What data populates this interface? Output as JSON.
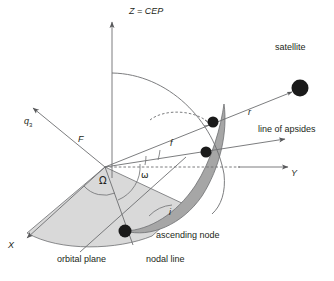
{
  "figure": {
    "background_color": "#ffffff",
    "line_color": "#58595b",
    "text_color": "#231f20",
    "equatorial_wedge_fill": "#d9d9d9",
    "orbital_wedge_fill": "#a6a6a6",
    "dot_color": "#1a1a1a"
  },
  "axes": [
    {
      "id": "z-axis",
      "label": "Z = CEP",
      "label_x": 129,
      "label_y": 8,
      "arrow": true
    },
    {
      "id": "y-axis",
      "label": "Y",
      "label_x": 291,
      "label_y": 174,
      "arrow": true
    },
    {
      "id": "x-axis",
      "label": "X",
      "label_x": 8,
      "label_y": 246,
      "arrow": true
    },
    {
      "id": "q3-axis",
      "label": "q",
      "sub": "3",
      "label_x": 24,
      "label_y": 122,
      "arrow": true
    }
  ],
  "labels": {
    "focus": "F",
    "satellite": "satellite",
    "radius": "r",
    "line_of_apsides": "line of apsides",
    "true_anomaly": "f",
    "arg_of_perigee": "ω",
    "raan": "Ω",
    "inclination": "i",
    "ascending_node": "ascending node",
    "orbital_plane": "orbital plane",
    "nodal_line": "nodal line"
  },
  "label_positions": {
    "focus": {
      "x": 78,
      "y": 140
    },
    "satellite": {
      "x": 275,
      "y": 48
    },
    "radius": {
      "x": 248,
      "y": 113
    },
    "line_of_apsides": {
      "x": 258,
      "y": 130
    },
    "true_anomaly": {
      "x": 170,
      "y": 144
    },
    "arg_of_perigee": {
      "x": 141,
      "y": 176
    },
    "raan": {
      "x": 99,
      "y": 182
    },
    "inclination": {
      "x": 169,
      "y": 213
    },
    "ascending_node": {
      "x": 156,
      "y": 236
    },
    "orbital_plane": {
      "x": 57,
      "y": 260
    },
    "nodal_line": {
      "x": 146,
      "y": 260
    }
  },
  "points": [
    {
      "id": "satellite-dot",
      "x": 300,
      "y": 88,
      "r": 8.5
    },
    {
      "id": "perigee-dot",
      "x": 213,
      "y": 122,
      "r": 5.5
    },
    {
      "id": "orbit-dot",
      "x": 206,
      "y": 152,
      "r": 5.5
    },
    {
      "id": "ascending-node-dot",
      "x": 125,
      "y": 231,
      "r": 6.5
    }
  ],
  "origin": {
    "x": 105,
    "y": 167
  }
}
